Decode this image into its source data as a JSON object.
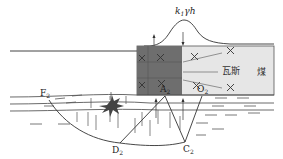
{
  "diagram": {
    "title": "",
    "load_label": {
      "base": "k",
      "sub": "1",
      "rest": "γh"
    },
    "labels": {
      "gas": "瓦斯",
      "coal": "煤",
      "F": {
        "base": "F",
        "sub": "2"
      },
      "A": {
        "base": "A",
        "sub": "2"
      },
      "O": {
        "base": "O",
        "sub": "2"
      },
      "D": {
        "base": "D",
        "sub": "2"
      },
      "C": {
        "base": "C",
        "sub": "2"
      }
    },
    "colors": {
      "line": "#333333",
      "dark_zone": "#6e6e6e",
      "coal_zone": "#e6e6e6",
      "star": "#444444",
      "background": "#ffffff"
    }
  }
}
